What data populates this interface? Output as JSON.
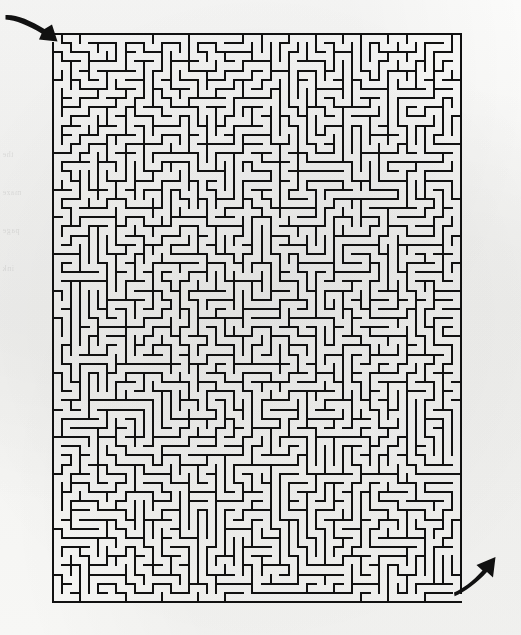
{
  "document": {
    "type": "printed-maze-puzzle",
    "title": "Rectangular Grid Maze",
    "medium": "scanned book page",
    "background_color": "#f6f6f4",
    "ink_color": "#111111"
  },
  "maze": {
    "shape": "rectangle",
    "columns": 45,
    "rows": 62,
    "cell_pitch_px": 9.07,
    "wall_thickness_px": 2,
    "bounds": {
      "left": 52,
      "top": 33,
      "right": 460,
      "bottom": 601
    },
    "width_px": 408,
    "height_px": 568,
    "border": "solid on all four sides except entrance and exit gaps",
    "perfect": true,
    "seed": 20240117
  },
  "entrance": {
    "label": "entrance",
    "position": "top-left",
    "gap_side": "left",
    "gap_cell_row": 0,
    "gap_x": 52,
    "gap_y": 33
  },
  "exit": {
    "label": "exit",
    "position": "bottom-right",
    "gap_side": "right",
    "gap_cell_row": 61,
    "gap_x": 460,
    "gap_y": 601
  },
  "arrows": [
    {
      "name": "entrance-arrow",
      "description": "curved tapering stroke sweeping from upper-left down to the right, arrowhead pointing into the maze opening",
      "color": "#111111",
      "start": {
        "x": 6,
        "y": 16
      },
      "end": {
        "x": 56,
        "y": 40
      }
    },
    {
      "name": "exit-arrow",
      "description": "curved tapering stroke sweeping from the maze opening down-left then up to the right, arrowhead pointing away from the maze",
      "color": "#111111",
      "start": {
        "x": 455,
        "y": 590
      },
      "end": {
        "x": 500,
        "y": 545
      }
    }
  ],
  "margin_ghost_text": {
    "description": "faint mirrored bleed-through text from the reverse side of the page",
    "lines": [
      "the",
      "maze",
      "page",
      "ink"
    ]
  }
}
